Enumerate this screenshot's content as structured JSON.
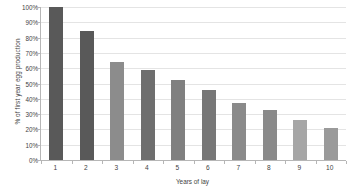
{
  "chart_data": {
    "type": "bar",
    "title": "",
    "xlabel": "Years of lay",
    "ylabel": "% of first year egg production",
    "categories": [
      "1",
      "2",
      "3",
      "4",
      "5",
      "6",
      "7",
      "8",
      "9",
      "10"
    ],
    "values": [
      100,
      84,
      64,
      59,
      52,
      46,
      37,
      33,
      26,
      21
    ],
    "ytick_labels": [
      "0%",
      "10%",
      "20%",
      "30%",
      "40%",
      "50%",
      "60%",
      "70%",
      "80%",
      "90%",
      "100%"
    ],
    "ytick_values": [
      0,
      10,
      20,
      30,
      40,
      50,
      60,
      70,
      80,
      90,
      100
    ],
    "ylim": [
      0,
      100
    ],
    "grid": true,
    "legend": "none",
    "bar_colors": [
      "#595959",
      "#595959",
      "#8c8c8c",
      "#6e6e6e",
      "#808080",
      "#777777",
      "#8a8a8a",
      "#8a8a8a",
      "#a6a6a6",
      "#9a9a9a"
    ],
    "axis_color": "#b6b6b6",
    "gridline_color": "#e4e4e4",
    "text_color": "#3f3f3f",
    "background": "#ffffff"
  }
}
